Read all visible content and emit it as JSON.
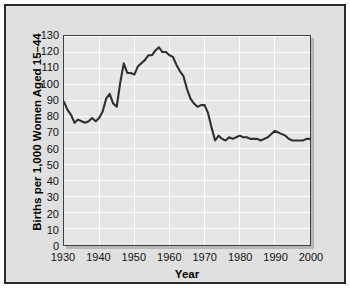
{
  "chart_data": {
    "type": "line",
    "title": "",
    "xlabel": "Year",
    "ylabel": "Births per 1,000 Women Aged 15–44",
    "xlim": [
      1930,
      2000
    ],
    "ylim": [
      0,
      130
    ],
    "grid": true,
    "legend": null,
    "xticks": [
      1930,
      1940,
      1950,
      1960,
      1970,
      1980,
      1990,
      2000
    ],
    "xtick_labels": [
      "1930",
      "1940",
      "1950",
      "1960",
      "1970",
      "1980",
      "1990",
      "2000"
    ],
    "yticks": [
      0,
      10,
      20,
      30,
      40,
      50,
      60,
      70,
      80,
      90,
      100,
      110,
      120,
      130
    ],
    "ytick_labels": [
      "0",
      "10",
      "20",
      "30",
      "40",
      "50",
      "60",
      "70",
      "80",
      "90",
      "100",
      "110",
      "120",
      "130"
    ],
    "line_color": "#2f2f2f",
    "plot_background": "#e6e6e6",
    "figure_background": "#e0e0e0",
    "gridline_color": "#ffffff",
    "series": [
      {
        "name": "General fertility rate",
        "x": [
          1930,
          1931,
          1932,
          1933,
          1934,
          1935,
          1936,
          1937,
          1938,
          1939,
          1940,
          1941,
          1942,
          1943,
          1944,
          1945,
          1946,
          1947,
          1948,
          1949,
          1950,
          1951,
          1952,
          1953,
          1954,
          1955,
          1956,
          1957,
          1958,
          1959,
          1960,
          1961,
          1962,
          1963,
          1964,
          1965,
          1966,
          1967,
          1968,
          1969,
          1970,
          1971,
          1972,
          1973,
          1974,
          1975,
          1976,
          1977,
          1978,
          1979,
          1980,
          1981,
          1982,
          1983,
          1984,
          1985,
          1986,
          1987,
          1988,
          1989,
          1990,
          1991,
          1992,
          1993,
          1994,
          1995,
          1996,
          1997,
          1998,
          1999,
          2000
        ],
        "values": [
          89,
          84,
          81,
          76,
          78,
          77,
          76,
          77,
          79,
          77,
          79,
          83,
          91,
          94,
          88,
          86,
          101,
          113,
          107,
          107,
          106,
          111,
          113,
          115,
          118,
          118,
          121,
          123,
          120,
          120,
          118,
          117,
          112,
          108,
          105,
          97,
          91,
          88,
          86,
          87,
          87,
          82,
          73,
          65,
          68,
          66,
          65,
          67,
          66,
          67,
          68,
          67,
          67,
          66,
          66,
          66,
          65,
          66,
          67,
          69,
          71,
          70,
          69,
          68,
          66,
          65,
          65,
          65,
          65,
          66,
          66
        ]
      }
    ]
  },
  "figure": {
    "watermark": ""
  }
}
